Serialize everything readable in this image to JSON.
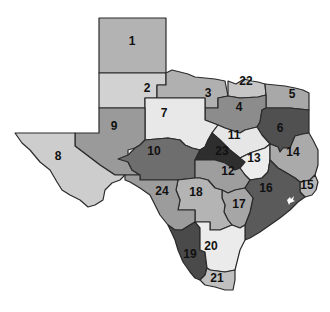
{
  "map": {
    "title": "Texas regions",
    "regions": [
      {
        "id": "1",
        "label": "1",
        "fill": "#b3b3b3",
        "lx": 132,
        "ly": 42
      },
      {
        "id": "2",
        "label": "2",
        "fill": "#d2d2d2",
        "lx": 147,
        "ly": 89
      },
      {
        "id": "3",
        "label": "3",
        "fill": "#b0b0b0",
        "lx": 208,
        "ly": 94
      },
      {
        "id": "4",
        "label": "4",
        "fill": "#8c8c8c",
        "lx": 239,
        "ly": 108
      },
      {
        "id": "5",
        "label": "5",
        "fill": "#a8a8a8",
        "lx": 292,
        "ly": 95
      },
      {
        "id": "6",
        "label": "6",
        "fill": "#505050",
        "lx": 280,
        "ly": 129
      },
      {
        "id": "7",
        "label": "7",
        "fill": "#e8e8e8",
        "lx": 164,
        "ly": 114
      },
      {
        "id": "8",
        "label": "8",
        "fill": "#cdcdcd",
        "lx": 58,
        "ly": 157
      },
      {
        "id": "9",
        "label": "9",
        "fill": "#9a9a9a",
        "lx": 114,
        "ly": 127
      },
      {
        "id": "10",
        "label": "10",
        "fill": "#6e6e6e",
        "lx": 154,
        "ly": 152
      },
      {
        "id": "11",
        "label": "11",
        "fill": "#e6e6e6",
        "lx": 234,
        "ly": 136
      },
      {
        "id": "12",
        "label": "12",
        "fill": "#9e9e9e",
        "lx": 228,
        "ly": 172
      },
      {
        "id": "13",
        "label": "13",
        "fill": "#ececec",
        "lx": 254,
        "ly": 159
      },
      {
        "id": "14",
        "label": "14",
        "fill": "#aaaaaa",
        "lx": 293,
        "ly": 153
      },
      {
        "id": "15",
        "label": "15",
        "fill": "#b8b8b8",
        "lx": 307,
        "ly": 186
      },
      {
        "id": "16",
        "label": "16",
        "fill": "#5a5a5a",
        "lx": 266,
        "ly": 189
      },
      {
        "id": "17",
        "label": "17",
        "fill": "#a6a6a6",
        "lx": 239,
        "ly": 205
      },
      {
        "id": "18",
        "label": "18",
        "fill": "#b4b4b4",
        "lx": 196,
        "ly": 193
      },
      {
        "id": "19",
        "label": "19",
        "fill": "#4a4a4a",
        "lx": 190,
        "ly": 255
      },
      {
        "id": "20",
        "label": "20",
        "fill": "#ebebeb",
        "lx": 211,
        "ly": 247
      },
      {
        "id": "21",
        "label": "21",
        "fill": "#c0c0c0",
        "lx": 217,
        "ly": 279
      },
      {
        "id": "22",
        "label": "22",
        "fill": "#c6c6c6",
        "lx": 246,
        "ly": 82
      },
      {
        "id": "23",
        "label": "23",
        "fill": "#2e2e2e",
        "lx": 222,
        "ly": 152
      },
      {
        "id": "24",
        "label": "24",
        "fill": "#9c9c9c",
        "lx": 162,
        "ly": 192
      }
    ]
  }
}
